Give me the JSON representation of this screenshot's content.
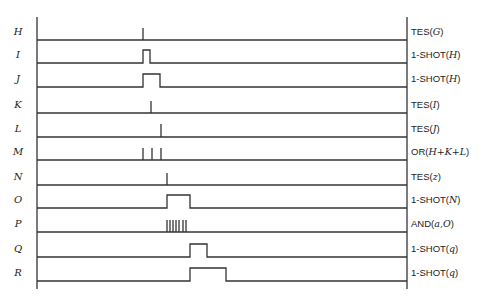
{
  "diagram": {
    "type": "timing-diagram",
    "axis": {
      "left_x": 37,
      "right_x": 407,
      "top_y": 17,
      "bottom_y": 289
    },
    "signals": [
      {
        "name": "H",
        "function": "TES",
        "arg": "G",
        "baseline_y": 40,
        "high_y": 28,
        "kind": "spikes",
        "times": [
          143
        ]
      },
      {
        "name": "I",
        "function": "1-SHOT",
        "arg": "H",
        "baseline_y": 63,
        "high_y": 50,
        "kind": "pulse",
        "start": 143,
        "end": 150
      },
      {
        "name": "J",
        "function": "1-SHOT",
        "arg": "H",
        "baseline_y": 87,
        "high_y": 74,
        "kind": "pulse",
        "start": 143,
        "end": 160
      },
      {
        "name": "K",
        "function": "TES",
        "arg": "I",
        "baseline_y": 113,
        "high_y": 101,
        "kind": "spikes",
        "times": [
          151
        ]
      },
      {
        "name": "L",
        "function": "TES",
        "arg": "J",
        "baseline_y": 137,
        "high_y": 124,
        "kind": "spikes",
        "times": [
          161
        ]
      },
      {
        "name": "M",
        "function": "OR",
        "arg": "H+K+L",
        "baseline_y": 160,
        "high_y": 148,
        "kind": "spikes",
        "times": [
          143,
          152,
          161
        ]
      },
      {
        "name": "N",
        "function": "TES",
        "arg": "z",
        "baseline_y": 185,
        "high_y": 173,
        "kind": "spikes",
        "times": [
          167
        ]
      },
      {
        "name": "O",
        "function": "1-SHOT",
        "arg": "N",
        "baseline_y": 208,
        "high_y": 195,
        "kind": "pulse",
        "start": 167,
        "end": 190
      },
      {
        "name": "P",
        "function": "AND",
        "arg": "a,O",
        "baseline_y": 232,
        "high_y": 220,
        "kind": "spikes",
        "times": [
          167,
          170,
          173,
          176,
          179,
          183,
          186
        ]
      },
      {
        "name": "Q",
        "function": "1-SHOT",
        "arg": "q",
        "baseline_y": 257,
        "high_y": 244,
        "kind": "pulse",
        "start": 190,
        "end": 207
      },
      {
        "name": "R",
        "function": "1-SHOT",
        "arg": "q",
        "baseline_y": 281,
        "high_y": 268,
        "kind": "pulse",
        "start": 190,
        "end": 226
      }
    ]
  },
  "labels": {
    "left": [
      "H",
      "I",
      "J",
      "K",
      "L",
      "M",
      "N",
      "O",
      "P",
      "Q",
      "R"
    ],
    "right": [
      {
        "fn": "TES",
        "arg": "G"
      },
      {
        "fn": "1-SHOT",
        "arg": "H"
      },
      {
        "fn": "1-SHOT",
        "arg": "H"
      },
      {
        "fn": "TES",
        "arg": "I"
      },
      {
        "fn": "TES",
        "arg": "J"
      },
      {
        "fn": "OR",
        "arg": "H+K+L"
      },
      {
        "fn": "TES",
        "arg": "z"
      },
      {
        "fn": "1-SHOT",
        "arg": "N"
      },
      {
        "fn": "AND",
        "arg": "a,O"
      },
      {
        "fn": "1-SHOT",
        "arg": "q"
      },
      {
        "fn": "1-SHOT",
        "arg": "q"
      }
    ]
  },
  "style": {
    "line_color": "#333333",
    "background": "#ffffff"
  }
}
